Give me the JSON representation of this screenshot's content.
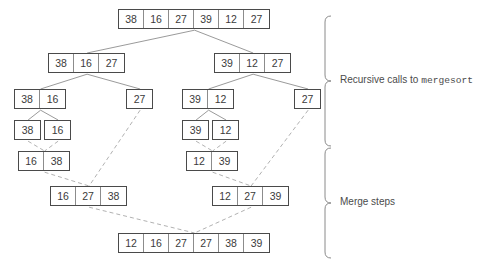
{
  "figure": {
    "canvas": {
      "width": 491,
      "height": 269
    },
    "colors": {
      "box_border": "#4a4a4a",
      "cell_divider": "#8c8c8c",
      "split_edge": "#8f8f8f",
      "merge_edge": "#a8a8a8",
      "brace": "#8a8a8a",
      "text": "#3b3b3b",
      "label_text": "#4b4b4b",
      "background": "#ffffff"
    }
  },
  "annotations": {
    "recursive": {
      "label_prefix": "Recursive calls to ",
      "label_code": "mergesort",
      "brace_top": 16,
      "brace_bottom": 146
    },
    "merge": {
      "label": "Merge steps",
      "brace_top": 148,
      "brace_bottom": 258
    }
  },
  "nodes": [
    {
      "id": "root",
      "phase": "split",
      "level": 0,
      "x": 118,
      "y": 9,
      "values": [
        "38",
        "16",
        "27",
        "39",
        "12",
        "27"
      ]
    },
    {
      "id": "L1-left",
      "phase": "split",
      "level": 1,
      "x": 48,
      "y": 53,
      "values": [
        "38",
        "16",
        "27"
      ]
    },
    {
      "id": "L1-right",
      "phase": "split",
      "level": 1,
      "x": 214,
      "y": 53,
      "values": [
        "39",
        "12",
        "27"
      ]
    },
    {
      "id": "L2-a",
      "phase": "split",
      "level": 2,
      "x": 14,
      "y": 89,
      "values": [
        "38",
        "16"
      ]
    },
    {
      "id": "L2-b",
      "phase": "split",
      "level": 2,
      "x": 126,
      "y": 89,
      "values": [
        "27"
      ]
    },
    {
      "id": "L2-c",
      "phase": "split",
      "level": 2,
      "x": 182,
      "y": 89,
      "values": [
        "39",
        "12"
      ]
    },
    {
      "id": "L2-d",
      "phase": "split",
      "level": 2,
      "x": 294,
      "y": 89,
      "values": [
        "27"
      ]
    },
    {
      "id": "L3-a",
      "phase": "split",
      "level": 3,
      "x": 14,
      "y": 120,
      "values": [
        "38"
      ]
    },
    {
      "id": "L3-b",
      "phase": "split",
      "level": 3,
      "x": 44,
      "y": 120,
      "values": [
        "16"
      ]
    },
    {
      "id": "L3-c",
      "phase": "split",
      "level": 3,
      "x": 182,
      "y": 120,
      "values": [
        "39"
      ]
    },
    {
      "id": "L3-d",
      "phase": "split",
      "level": 3,
      "x": 212,
      "y": 120,
      "values": [
        "12"
      ]
    },
    {
      "id": "M1-left",
      "phase": "merge",
      "level": 4,
      "x": 18,
      "y": 151,
      "values": [
        "16",
        "38"
      ]
    },
    {
      "id": "M1-right",
      "phase": "merge",
      "level": 4,
      "x": 186,
      "y": 151,
      "values": [
        "12",
        "39"
      ]
    },
    {
      "id": "M2-left",
      "phase": "merge",
      "level": 5,
      "x": 50,
      "y": 186,
      "values": [
        "16",
        "27",
        "38"
      ]
    },
    {
      "id": "M2-right",
      "phase": "merge",
      "level": 5,
      "x": 212,
      "y": 186,
      "values": [
        "12",
        "27",
        "39"
      ]
    },
    {
      "id": "M3-final",
      "phase": "merge",
      "level": 6,
      "x": 118,
      "y": 233,
      "values": [
        "12",
        "16",
        "27",
        "27",
        "38",
        "39"
      ]
    }
  ],
  "edges": [
    {
      "from": "root",
      "to": "L1-left",
      "kind": "split"
    },
    {
      "from": "root",
      "to": "L1-right",
      "kind": "split"
    },
    {
      "from": "L1-left",
      "to": "L2-a",
      "kind": "split"
    },
    {
      "from": "L1-left",
      "to": "L2-b",
      "kind": "split"
    },
    {
      "from": "L1-right",
      "to": "L2-c",
      "kind": "split"
    },
    {
      "from": "L1-right",
      "to": "L2-d",
      "kind": "split"
    },
    {
      "from": "L2-a",
      "to": "L3-a",
      "kind": "split"
    },
    {
      "from": "L2-a",
      "to": "L3-b",
      "kind": "split"
    },
    {
      "from": "L2-c",
      "to": "L3-c",
      "kind": "split"
    },
    {
      "from": "L2-c",
      "to": "L3-d",
      "kind": "split"
    },
    {
      "from": "L3-a",
      "to": "M1-left",
      "kind": "merge"
    },
    {
      "from": "L3-b",
      "to": "M1-left",
      "kind": "merge"
    },
    {
      "from": "L3-c",
      "to": "M1-right",
      "kind": "merge"
    },
    {
      "from": "L3-d",
      "to": "M1-right",
      "kind": "merge"
    },
    {
      "from": "M1-left",
      "to": "M2-left",
      "kind": "merge"
    },
    {
      "from": "L2-b",
      "to": "M2-left",
      "kind": "merge"
    },
    {
      "from": "M1-right",
      "to": "M2-right",
      "kind": "merge"
    },
    {
      "from": "L2-d",
      "to": "M2-right",
      "kind": "merge"
    },
    {
      "from": "M2-left",
      "to": "M3-final",
      "kind": "merge"
    },
    {
      "from": "M2-right",
      "to": "M3-final",
      "kind": "merge"
    }
  ]
}
